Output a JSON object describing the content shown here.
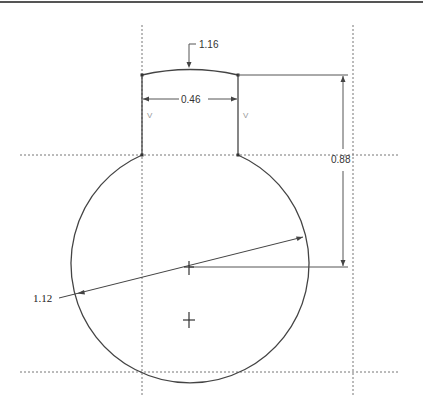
{
  "drawing": {
    "type": "CAD sketch",
    "colors": {
      "geometry": "#444444",
      "dimension": "#555555",
      "centerline": "#777777",
      "border": "#555555",
      "constraint_mark": "#999999"
    },
    "dimensions": {
      "arc_radius": "1.16",
      "neck_width": "0.46",
      "vertical_offset": "0.88",
      "circle_radius": "1.12"
    },
    "constraint_marks": {
      "left_vertical": "V",
      "right_vertical": "V"
    }
  }
}
